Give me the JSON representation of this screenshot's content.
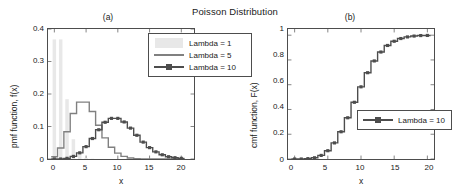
{
  "figure": {
    "title": "Poisson Distribution",
    "panel_a_tag": "(a)",
    "panel_b_tag": "(b)"
  },
  "colors": {
    "lambda1": "#e8e8e8",
    "lambda5": "#808080",
    "lambda10": "#4d4d4d",
    "axis": "#4d4d4d",
    "text": "#1a1a1a"
  },
  "panel_a": {
    "xlabel": "x",
    "ylabel": "pmf function, f(x)",
    "xticks": [
      "0",
      "5",
      "10",
      "15",
      "20"
    ],
    "yticks": [
      "0",
      "0.1",
      "0.2",
      "0.3",
      "0.4"
    ],
    "legend": [
      {
        "label": "Lambda = 1",
        "style": "patch"
      },
      {
        "label": "Lambda = 5",
        "style": "line"
      },
      {
        "label": "Lambda = 10",
        "style": "line-marker"
      }
    ]
  },
  "panel_b": {
    "xlabel": "x",
    "ylabel": "cmf function, F(x)",
    "xticks": [
      "0",
      "5",
      "10",
      "15",
      "20"
    ],
    "yticks": [
      "0",
      "0.2",
      "0.4",
      "0.6",
      "0.8",
      "1"
    ],
    "legend": [
      {
        "label": "Lambda = 10",
        "style": "line-marker"
      }
    ]
  },
  "chart_data": [
    {
      "type": "bar",
      "panel": "(a)",
      "title": "Poisson Distribution",
      "subtitle": "(a)",
      "xlabel": "x",
      "ylabel": "pmf function, f(x)",
      "xlim": [
        -1,
        22
      ],
      "ylim": [
        0,
        0.4
      ],
      "xticks": [
        0,
        5,
        10,
        15,
        20
      ],
      "yticks": [
        0,
        0.1,
        0.2,
        0.3,
        0.4
      ],
      "grid": false,
      "legend_position": "top-right",
      "x": [
        0,
        1,
        2,
        3,
        4,
        5,
        6,
        7,
        8,
        9,
        10,
        11,
        12,
        13,
        14,
        15,
        16,
        17,
        18,
        19,
        20
      ],
      "series": [
        {
          "name": "Lambda = 1",
          "render": "bar",
          "color": "#e8e8e8",
          "values": [
            0.368,
            0.368,
            0.184,
            0.061,
            0.015,
            0.003,
            0.001,
            0.0,
            0.0,
            0.0,
            0.0,
            0.0,
            0.0,
            0.0,
            0.0,
            0.0,
            0.0,
            0.0,
            0.0,
            0.0,
            0.0
          ]
        },
        {
          "name": "Lambda = 5",
          "render": "stairs",
          "color": "#808080",
          "values": [
            0.007,
            0.034,
            0.084,
            0.14,
            0.175,
            0.175,
            0.146,
            0.104,
            0.065,
            0.036,
            0.018,
            0.008,
            0.003,
            0.001,
            0.0,
            0.0,
            0.0,
            0.0,
            0.0,
            0.0,
            0.0
          ]
        },
        {
          "name": "Lambda = 10",
          "render": "stairs-marker",
          "color": "#4d4d4d",
          "values": [
            0.0,
            0.0,
            0.002,
            0.008,
            0.019,
            0.038,
            0.063,
            0.09,
            0.113,
            0.125,
            0.125,
            0.114,
            0.095,
            0.073,
            0.052,
            0.035,
            0.022,
            0.013,
            0.007,
            0.004,
            0.002
          ]
        }
      ]
    },
    {
      "type": "line",
      "panel": "(b)",
      "subtitle": "(b)",
      "xlabel": "x",
      "ylabel": "cmf function, F(x)",
      "xlim": [
        -1,
        21
      ],
      "ylim": [
        0,
        1.05
      ],
      "xticks": [
        0,
        5,
        10,
        15,
        20
      ],
      "yticks": [
        0,
        0.2,
        0.4,
        0.6,
        0.8,
        1
      ],
      "grid": false,
      "legend_position": "center-right",
      "x": [
        0,
        1,
        2,
        3,
        4,
        5,
        6,
        7,
        8,
        9,
        10,
        11,
        12,
        13,
        14,
        15,
        16,
        17,
        18,
        19,
        20
      ],
      "series": [
        {
          "name": "Lambda = 10",
          "render": "stairs-marker",
          "color": "#4d4d4d",
          "values": [
            0.0,
            0.0,
            0.003,
            0.01,
            0.029,
            0.067,
            0.13,
            0.22,
            0.333,
            0.458,
            0.583,
            0.697,
            0.792,
            0.864,
            0.917,
            0.951,
            0.973,
            0.986,
            0.993,
            0.997,
            0.998
          ]
        }
      ]
    }
  ]
}
